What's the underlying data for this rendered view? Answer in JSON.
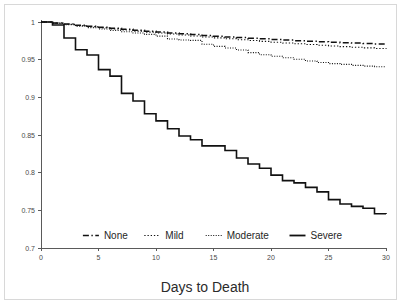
{
  "figure": {
    "background_color": "#ffffff",
    "frame_color": "#d8d8d8",
    "axis_color": "#5a5a5a",
    "line_color": "#111111"
  },
  "chart_data": {
    "type": "line",
    "title": "",
    "subtitle": "",
    "xlabel": "Days to Death",
    "ylabel": "",
    "xlim": [
      0,
      30
    ],
    "ylim": [
      0.7,
      1
    ],
    "xticks": [
      0,
      5,
      10,
      15,
      20,
      25,
      30
    ],
    "xtick_labels": [
      "0",
      "5",
      "10",
      "15",
      "20",
      "25",
      "30"
    ],
    "yticks": [
      0.7,
      0.75,
      0.8,
      0.85,
      0.9,
      0.95,
      1
    ],
    "ytick_labels": [
      "0.7",
      "0.75",
      "0.8",
      "0.85",
      "0.9",
      "0.95",
      "1"
    ],
    "grid": false,
    "legend_position": "bottom",
    "step_type": "post",
    "series": [
      {
        "name": "None",
        "line_style": "dash-dot",
        "line_width": 1.5,
        "color": "#111111",
        "x": [
          0,
          1,
          2,
          3,
          4,
          5,
          6,
          7,
          8,
          9,
          10,
          11,
          12,
          13,
          14,
          15,
          16,
          17,
          18,
          19,
          20,
          21,
          22,
          23,
          24,
          25,
          26,
          27,
          28,
          29,
          30
        ],
        "values": [
          1,
          0.9988,
          0.9973,
          0.9958,
          0.9944,
          0.993,
          0.9916,
          0.9903,
          0.989,
          0.9878,
          0.9866,
          0.9855,
          0.9844,
          0.9833,
          0.9822,
          0.9812,
          0.9802,
          0.9793,
          0.9784,
          0.9776,
          0.9768,
          0.976,
          0.9752,
          0.9745,
          0.9738,
          0.9732,
          0.9726,
          0.972,
          0.9714,
          0.9709,
          0.9704
        ]
      },
      {
        "name": "Mild",
        "line_style": "dotted",
        "line_width": 1.1,
        "color": "#111111",
        "x": [
          0,
          1,
          2,
          3,
          4,
          5,
          6,
          7,
          8,
          9,
          10,
          11,
          12,
          13,
          14,
          15,
          16,
          17,
          18,
          19,
          20,
          21,
          22,
          23,
          24,
          25,
          26,
          27,
          28,
          29,
          30
        ],
        "values": [
          1,
          0.9985,
          0.9968,
          0.9952,
          0.9937,
          0.9922,
          0.9907,
          0.9893,
          0.9879,
          0.9866,
          0.9853,
          0.984,
          0.9827,
          0.9814,
          0.9801,
          0.9789,
          0.9777,
          0.9765,
          0.9754,
          0.9743,
          0.9732,
          0.9721,
          0.9711,
          0.9701,
          0.9691,
          0.9682,
          0.9673,
          0.9664,
          0.9656,
          0.9648,
          0.9641
        ]
      },
      {
        "name": "Moderate",
        "line_style": "fine-dotted",
        "line_width": 1.1,
        "color": "#111111",
        "x": [
          0,
          1,
          2,
          3,
          4,
          5,
          6,
          7,
          8,
          9,
          10,
          11,
          12,
          13,
          14,
          15,
          16,
          17,
          18,
          19,
          20,
          21,
          22,
          23,
          24,
          25,
          26,
          27,
          28,
          29,
          30
        ],
        "values": [
          1,
          0.9982,
          0.9963,
          0.9944,
          0.9925,
          0.9907,
          0.9889,
          0.9871,
          0.9853,
          0.9836,
          0.9812,
          0.9775,
          0.9762,
          0.9756,
          0.9705,
          0.9676,
          0.9655,
          0.9628,
          0.9594,
          0.9566,
          0.9545,
          0.9526,
          0.9505,
          0.9482,
          0.9462,
          0.9448,
          0.9437,
          0.9424,
          0.9414,
          0.9406,
          0.9402
        ]
      },
      {
        "name": "Severe",
        "line_style": "solid",
        "line_width": 1.6,
        "color": "#111111",
        "x": [
          0,
          1,
          2,
          3,
          4,
          5,
          6,
          7,
          8,
          9,
          10,
          11,
          12,
          13,
          14,
          15,
          16,
          17,
          18,
          19,
          20,
          21,
          22,
          23,
          24,
          25,
          26,
          27,
          28,
          29,
          30
        ],
        "values": [
          1,
          0.996,
          0.9788,
          0.9632,
          0.9562,
          0.9368,
          0.9282,
          0.9053,
          0.8952,
          0.8782,
          0.8687,
          0.8583,
          0.8487,
          0.8436,
          0.8355,
          0.8355,
          0.8295,
          0.8195,
          0.8115,
          0.8059,
          0.7968,
          0.7895,
          0.7865,
          0.7805,
          0.7745,
          0.7642,
          0.7585,
          0.7552,
          0.7528,
          0.7455,
          0.7452
        ]
      }
    ]
  },
  "legend": {
    "entries": [
      {
        "label": "None",
        "style": "dash-dot"
      },
      {
        "label": "Mild",
        "style": "dotted"
      },
      {
        "label": "Moderate",
        "style": "fine-dotted"
      },
      {
        "label": "Severe",
        "style": "solid"
      }
    ]
  }
}
